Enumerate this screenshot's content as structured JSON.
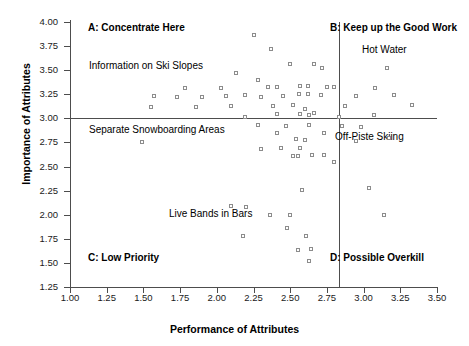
{
  "chart_data": {
    "type": "scatter",
    "title": "",
    "xlabel": "Performance of Attributes",
    "ylabel": "Importance of Attributes",
    "xlim": [
      1.0,
      3.5
    ],
    "ylim": [
      1.25,
      4.0
    ],
    "xticks": [
      "1.00",
      "1.25",
      "1.50",
      "1.75",
      "2.00",
      "2.25",
      "2.50",
      "2.75",
      "3.00",
      "3.25",
      "3.50"
    ],
    "yticks": [
      "1.25",
      "1.50",
      "1.75",
      "2.00",
      "2.25",
      "2.50",
      "2.75",
      "3.00",
      "3.25",
      "3.50",
      "3.75",
      "4.00"
    ],
    "xtick_values": [
      1.0,
      1.25,
      1.5,
      1.75,
      2.0,
      2.25,
      2.5,
      2.75,
      3.0,
      3.25,
      3.5
    ],
    "ytick_values": [
      1.25,
      1.5,
      1.75,
      2.0,
      2.25,
      2.5,
      2.75,
      3.0,
      3.25,
      3.5,
      3.75,
      4.0
    ],
    "grid": false,
    "legend": null,
    "crosshair": {
      "x": 2.83,
      "y": 3.0
    },
    "quadrants": [
      {
        "id": "A",
        "label": "A: Concentrate Here",
        "position": "top-left"
      },
      {
        "id": "B",
        "label": "B: Keep up the Good Work",
        "position": "top-right"
      },
      {
        "id": "C",
        "label": "C: Low Priority",
        "position": "bottom-left"
      },
      {
        "id": "D",
        "label": "D: Possible Overkill",
        "position": "bottom-right"
      }
    ],
    "annotations": [
      {
        "text": "Information on Ski Slopes",
        "x": 1.6,
        "y": 3.59
      },
      {
        "text": "Separate Snowboarding Areas",
        "x": 1.6,
        "y": 2.92
      },
      {
        "text": "Hot Water",
        "x": 3.13,
        "y": 3.77
      },
      {
        "text": "Off-Piste Skiing",
        "x": 2.95,
        "y": 2.85
      },
      {
        "text": "Live Bands in Bars",
        "x": 2.14,
        "y": 2.0
      }
    ],
    "points": [
      {
        "x": 2.25,
        "y": 3.87
      },
      {
        "x": 2.37,
        "y": 3.72
      },
      {
        "x": 2.13,
        "y": 3.47
      },
      {
        "x": 2.28,
        "y": 3.4
      },
      {
        "x": 2.5,
        "y": 3.56
      },
      {
        "x": 2.66,
        "y": 3.56
      },
      {
        "x": 2.72,
        "y": 3.52
      },
      {
        "x": 3.16,
        "y": 3.52
      },
      {
        "x": 1.78,
        "y": 3.31
      },
      {
        "x": 2.03,
        "y": 3.31
      },
      {
        "x": 2.35,
        "y": 3.33
      },
      {
        "x": 2.41,
        "y": 3.33
      },
      {
        "x": 2.57,
        "y": 3.34
      },
      {
        "x": 2.62,
        "y": 3.34
      },
      {
        "x": 2.75,
        "y": 3.33
      },
      {
        "x": 2.8,
        "y": 3.33
      },
      {
        "x": 3.08,
        "y": 3.31
      },
      {
        "x": 1.57,
        "y": 3.23
      },
      {
        "x": 1.73,
        "y": 3.22
      },
      {
        "x": 1.9,
        "y": 3.22
      },
      {
        "x": 2.06,
        "y": 3.23
      },
      {
        "x": 2.19,
        "y": 3.24
      },
      {
        "x": 2.3,
        "y": 3.22
      },
      {
        "x": 2.45,
        "y": 3.23
      },
      {
        "x": 2.56,
        "y": 3.25
      },
      {
        "x": 2.62,
        "y": 3.25
      },
      {
        "x": 2.71,
        "y": 3.24
      },
      {
        "x": 2.95,
        "y": 3.23
      },
      {
        "x": 3.21,
        "y": 3.24
      },
      {
        "x": 3.33,
        "y": 3.14
      },
      {
        "x": 1.55,
        "y": 3.12
      },
      {
        "x": 1.86,
        "y": 3.12
      },
      {
        "x": 2.1,
        "y": 3.13
      },
      {
        "x": 2.38,
        "y": 3.13
      },
      {
        "x": 2.52,
        "y": 3.14
      },
      {
        "x": 2.6,
        "y": 3.1
      },
      {
        "x": 2.87,
        "y": 3.13
      },
      {
        "x": 2.41,
        "y": 3.05
      },
      {
        "x": 2.57,
        "y": 3.05
      },
      {
        "x": 2.63,
        "y": 3.04
      },
      {
        "x": 2.66,
        "y": 3.06
      },
      {
        "x": 3.07,
        "y": 3.04
      },
      {
        "x": 2.19,
        "y": 3.01
      },
      {
        "x": 2.83,
        "y": 3.01
      },
      {
        "x": 1.49,
        "y": 2.75
      },
      {
        "x": 2.28,
        "y": 2.93
      },
      {
        "x": 2.47,
        "y": 2.92
      },
      {
        "x": 2.63,
        "y": 2.93
      },
      {
        "x": 2.85,
        "y": 2.92
      },
      {
        "x": 2.98,
        "y": 2.91
      },
      {
        "x": 2.41,
        "y": 2.85
      },
      {
        "x": 2.73,
        "y": 2.85
      },
      {
        "x": 2.95,
        "y": 2.77
      },
      {
        "x": 3.17,
        "y": 2.8
      },
      {
        "x": 2.54,
        "y": 2.79
      },
      {
        "x": 2.6,
        "y": 2.78
      },
      {
        "x": 2.3,
        "y": 2.68
      },
      {
        "x": 2.44,
        "y": 2.69
      },
      {
        "x": 2.57,
        "y": 2.69
      },
      {
        "x": 2.52,
        "y": 2.61
      },
      {
        "x": 2.55,
        "y": 2.61
      },
      {
        "x": 2.65,
        "y": 2.62
      },
      {
        "x": 2.73,
        "y": 2.62
      },
      {
        "x": 2.8,
        "y": 2.55
      },
      {
        "x": 2.1,
        "y": 2.09
      },
      {
        "x": 2.58,
        "y": 2.26
      },
      {
        "x": 3.04,
        "y": 2.28
      },
      {
        "x": 2.2,
        "y": 2.08
      },
      {
        "x": 2.36,
        "y": 2.0
      },
      {
        "x": 2.5,
        "y": 2.0
      },
      {
        "x": 2.18,
        "y": 1.78
      },
      {
        "x": 2.48,
        "y": 1.86
      },
      {
        "x": 2.61,
        "y": 1.78
      },
      {
        "x": 3.14,
        "y": 2.0
      },
      {
        "x": 2.55,
        "y": 1.63
      },
      {
        "x": 2.64,
        "y": 1.64
      },
      {
        "x": 2.63,
        "y": 1.52
      }
    ]
  },
  "bottom_caption": ""
}
